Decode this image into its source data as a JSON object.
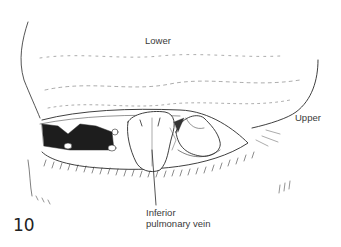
{
  "figure": {
    "number": "10",
    "labels": {
      "lower": "Lower",
      "upper": "Upper",
      "inferior_pulmonary_vein_line1": "Inferior",
      "inferior_pulmonary_vein_line2": "pulmonary vein"
    },
    "colors": {
      "background": "#ffffff",
      "ink": "#2a2a2a",
      "label_text": "#3a3a3a"
    }
  }
}
